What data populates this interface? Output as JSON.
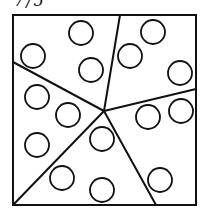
{
  "caption": "7/5",
  "figure": {
    "frame": {
      "x": 13,
      "y": 15,
      "width": 183,
      "height": 190
    },
    "center": {
      "x": 104,
      "y": 111
    },
    "dividers": [
      {
        "name": "divider-top",
        "x": 120,
        "y": 15
      },
      {
        "name": "divider-left",
        "x": 13,
        "y": 62
      },
      {
        "name": "divider-right",
        "x": 196,
        "y": 89
      },
      {
        "name": "divider-bottom-left",
        "x": 13,
        "y": 205
      },
      {
        "name": "divider-bottom-right",
        "x": 156,
        "y": 205
      }
    ],
    "circle_radius": 12,
    "circles": [
      {
        "x": 81,
        "y": 33
      },
      {
        "x": 33,
        "y": 56
      },
      {
        "x": 91,
        "y": 70
      },
      {
        "x": 153,
        "y": 32
      },
      {
        "x": 130,
        "y": 56
      },
      {
        "x": 180,
        "y": 73
      },
      {
        "x": 37,
        "y": 97
      },
      {
        "x": 68,
        "y": 115
      },
      {
        "x": 148,
        "y": 117
      },
      {
        "x": 181,
        "y": 111
      },
      {
        "x": 37,
        "y": 145
      },
      {
        "x": 102,
        "y": 139
      },
      {
        "x": 62,
        "y": 178
      },
      {
        "x": 102,
        "y": 190
      },
      {
        "x": 160,
        "y": 180
      }
    ],
    "stroke_color": "#111111"
  }
}
